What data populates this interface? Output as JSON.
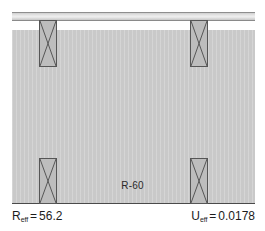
{
  "figure": {
    "name": "wall-assembly-cross-section",
    "cavity_label": "R-60",
    "colors": {
      "cavity_fill": "#c9c9c9",
      "stud_fill": "#bdbdbd",
      "stud_outline": "#565656",
      "deck_fill": "#e4e4e4",
      "rule": "#4a4a4a",
      "text": "#1c1c1c"
    }
  },
  "results": {
    "effective_r": {
      "symbol": "R",
      "subscript": "eff",
      "equals": "=",
      "value": "56.2"
    },
    "effective_u": {
      "symbol": "U",
      "subscript": "eff",
      "equals": "=",
      "value": "0.0178"
    }
  },
  "studs": [
    {
      "name": "stud-top-left",
      "position": "top-left"
    },
    {
      "name": "stud-top-right",
      "position": "top-right"
    },
    {
      "name": "stud-bottom-left",
      "position": "bottom-left"
    },
    {
      "name": "stud-bottom-right",
      "position": "bottom-right"
    }
  ]
}
